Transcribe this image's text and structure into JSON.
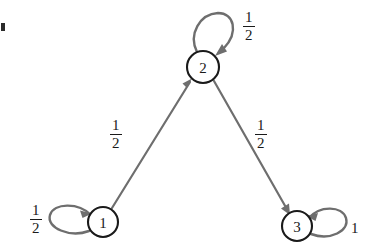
{
  "diagram": {
    "type": "state-transition-graph",
    "edge_color": "#6e6e6e",
    "node_stroke_color": "#1a1a1a",
    "background_color": "#ffffff",
    "nodes": [
      {
        "id": "1",
        "label": "1",
        "cx": 103,
        "cy": 222,
        "r": 15
      },
      {
        "id": "2",
        "label": "2",
        "cx": 203,
        "cy": 67,
        "r": 16
      },
      {
        "id": "3",
        "label": "3",
        "cx": 297,
        "cy": 226,
        "r": 15
      }
    ],
    "edges": [
      {
        "from": "1",
        "to": "1",
        "kind": "self-loop",
        "numerator": "1",
        "denominator": "2",
        "label_x": 30,
        "label_y": 203
      },
      {
        "from": "1",
        "to": "2",
        "kind": "directed",
        "numerator": "1",
        "denominator": "2",
        "label_x": 110,
        "label_y": 118
      },
      {
        "from": "2",
        "to": "2",
        "kind": "self-loop",
        "numerator": "1",
        "denominator": "2",
        "label_x": 243,
        "label_y": 10
      },
      {
        "from": "2",
        "to": "3",
        "kind": "directed",
        "numerator": "1",
        "denominator": "2",
        "label_x": 255,
        "label_y": 118
      },
      {
        "from": "3",
        "to": "3",
        "kind": "self-loop",
        "whole": "1",
        "label_x": 351,
        "label_y": 221
      }
    ]
  }
}
